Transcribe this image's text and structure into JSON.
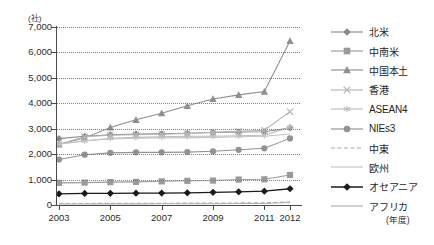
{
  "chart_data": {
    "type": "line",
    "title": "",
    "xlabel": "(年度)",
    "ylabel": "(社)",
    "ylim": [
      0,
      7000
    ],
    "ytick_values": [
      7000,
      6000,
      5000,
      4000,
      3000,
      2000,
      1000,
      0
    ],
    "ytick_labels": [
      "7,000",
      "6,000",
      "5,000",
      "4,000",
      "3,000",
      "2,000",
      "1,000",
      "0"
    ],
    "grid": true,
    "legend_position": "right",
    "x": [
      2003,
      2004,
      2005,
      2006,
      2007,
      2008,
      2009,
      2010,
      2011,
      2012
    ],
    "x_tick_labels": [
      "2003",
      "2005",
      "2007",
      "2009",
      "2011",
      "2012"
    ],
    "x_ticks": [
      2003,
      2005,
      2007,
      2009,
      2011,
      2012
    ],
    "series": [
      {
        "name": "北米",
        "marker": "diamond",
        "color": "#8a8a8a",
        "values": [
          2610,
          2700,
          2760,
          2790,
          2800,
          2820,
          2850,
          2870,
          2880,
          3030
        ]
      },
      {
        "name": "中南米",
        "marker": "square",
        "color": "#9a9a9a",
        "values": [
          870,
          880,
          900,
          910,
          930,
          950,
          960,
          1000,
          1010,
          1180
        ]
      },
      {
        "name": "中国本土",
        "marker": "triangle",
        "color": "#8f8f8f",
        "values": [
          2380,
          2640,
          3050,
          3350,
          3610,
          3900,
          4170,
          4330,
          4460,
          6450
        ]
      },
      {
        "name": "香港",
        "marker": "x",
        "color": "#b5b5b5",
        "values": [
          2390,
          2680,
          2740,
          2760,
          2780,
          2810,
          2860,
          2900,
          2940,
          3670
        ]
      },
      {
        "name": "ASEAN4",
        "marker": "star",
        "color": "#bdbdbd",
        "values": [
          2400,
          2520,
          2620,
          2660,
          2680,
          2700,
          2700,
          2720,
          2740,
          3060
        ]
      },
      {
        "name": "NIEs3",
        "marker": "circle",
        "color": "#929292",
        "values": [
          1790,
          1980,
          2050,
          2070,
          2070,
          2080,
          2110,
          2170,
          2230,
          2620
        ]
      },
      {
        "name": "中東",
        "marker": "dashed-line",
        "color": "#a8a8a8",
        "values": [
          60,
          62,
          64,
          66,
          70,
          74,
          78,
          82,
          88,
          120
        ]
      },
      {
        "name": "欧州",
        "marker": "line",
        "color": "#c4c4c4",
        "values": [
          2390,
          2530,
          2600,
          2630,
          2640,
          2650,
          2660,
          2680,
          2700,
          2790
        ]
      },
      {
        "name": "オセアニア",
        "marker": "filled-diamond",
        "color": "#1b1b1b",
        "values": [
          440,
          455,
          460,
          465,
          470,
          480,
          500,
          520,
          545,
          640
        ]
      },
      {
        "name": "アフリカ",
        "marker": "line",
        "color": "#b0b0b0",
        "values": [
          40,
          42,
          44,
          45,
          47,
          50,
          53,
          56,
          60,
          95
        ]
      }
    ]
  }
}
